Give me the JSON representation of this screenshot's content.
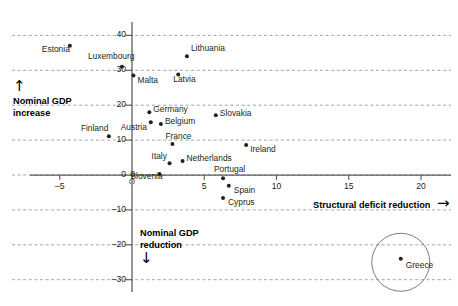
{
  "chart_data": {
    "type": "scatter",
    "title": "",
    "xlabel": "Structural deficit reduction",
    "ylabel": "Nominal GDP increase",
    "xlim": [
      -7.5,
      21.5
    ],
    "ylim": [
      -33,
      43
    ],
    "xticks": [
      -5,
      0,
      5,
      10,
      15,
      20
    ],
    "yticks": [
      -30,
      -20,
      -10,
      0,
      10,
      20,
      30,
      40
    ],
    "grid": "horizontal-dashed",
    "legend": "none",
    "annotations": [
      {
        "name": "greece-highlight-circle",
        "label": "Greece",
        "shape": "circle",
        "cx": 18.6,
        "cy": -25.0,
        "r_px": 29
      }
    ],
    "points": [
      {
        "label": "Estonia",
        "x": -4.3,
        "y": 37.0
      },
      {
        "label": "Luxembourg",
        "x": -0.7,
        "y": 31.0
      },
      {
        "label": "Malta",
        "x": 0.1,
        "y": 28.5
      },
      {
        "label": "Latvia",
        "x": 3.2,
        "y": 28.8
      },
      {
        "label": "Lithuania",
        "x": 3.8,
        "y": 34.0
      },
      {
        "label": "Germany",
        "x": 1.2,
        "y": 18.0
      },
      {
        "label": "Austria",
        "x": 1.3,
        "y": 15.1
      },
      {
        "label": "Belgium",
        "x": 2.0,
        "y": 14.6
      },
      {
        "label": "Finland",
        "x": -1.6,
        "y": 11.1
      },
      {
        "label": "Slovakia",
        "x": 5.8,
        "y": 17.1
      },
      {
        "label": "France",
        "x": 2.8,
        "y": 8.9
      },
      {
        "label": "Ireland",
        "x": 7.9,
        "y": 8.6
      },
      {
        "label": "Netherlands",
        "x": 3.5,
        "y": 4.0
      },
      {
        "label": "Italy",
        "x": 2.6,
        "y": 3.4
      },
      {
        "label": "Slovenia",
        "x": 1.9,
        "y": 0.3
      },
      {
        "label": "Portugal",
        "x": 6.3,
        "y": -0.9
      },
      {
        "label": "Spain",
        "x": 6.7,
        "y": -3.1
      },
      {
        "label": "Cyprus",
        "x": 6.3,
        "y": -6.6
      },
      {
        "label": "Greece",
        "x": 18.6,
        "y": -24.0
      }
    ]
  },
  "axis_labels": {
    "y_positive_line1": "Nominal GDP",
    "y_positive_line2": "increase",
    "y_negative_line1": "Nominal GDP",
    "y_negative_line2": "reduction",
    "x_positive": "Structural deficit reduction",
    "arrow_up": "↑",
    "arrow_down": "↓",
    "arrow_right": "→"
  },
  "x_tick_labels": [
    "–5",
    "0",
    "5",
    "10",
    "15",
    "20"
  ],
  "y_tick_labels": [
    "40",
    "30",
    "20",
    "10",
    "0",
    "–10",
    "–20",
    "–30"
  ],
  "colors": {
    "point": "#231f20",
    "axis": "#58595b",
    "grid": "#8a8c8e",
    "text": "#231f20",
    "bold_text": "#000000",
    "circle_stroke": "#6d6e71",
    "background": "#ffffff"
  }
}
